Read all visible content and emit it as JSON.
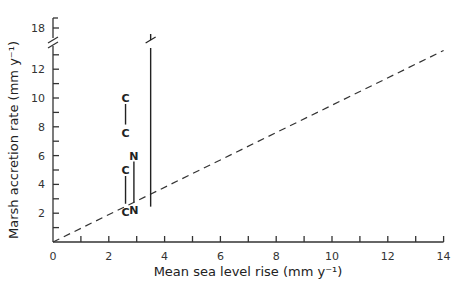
{
  "chart_data": {
    "type": "scatter",
    "title": "",
    "xlabel": "Mean sea level rise (mm y⁻¹)",
    "ylabel": "Marsh accretion rate (mm y⁻¹)",
    "xlim": [
      0,
      14
    ],
    "ylim": [
      0,
      18
    ],
    "y_axis_break": {
      "from": 14,
      "to": 18
    },
    "x_ticks": [
      0,
      2,
      4,
      6,
      8,
      10,
      12,
      14
    ],
    "x_tick_labels": [
      "0",
      "2",
      "4",
      "6",
      "8",
      "10",
      "12",
      "14"
    ],
    "y_ticks": [
      2,
      4,
      6,
      8,
      10,
      12,
      18
    ],
    "y_tick_labels": [
      "2",
      "4",
      "6",
      "8",
      "10",
      "12",
      "18"
    ],
    "grid": false,
    "legend": null,
    "reference_line": {
      "style": "dashed",
      "from": [
        0,
        0
      ],
      "to": [
        14,
        13.3
      ],
      "label": "accretion = sea level rise"
    },
    "series": [
      {
        "name": "C",
        "points": [
          [
            2.6,
            10.0
          ],
          [
            2.6,
            7.6
          ]
        ],
        "connected": true
      },
      {
        "name": "C",
        "points": [
          [
            2.6,
            5.0
          ],
          [
            2.6,
            2.1
          ]
        ],
        "connected": true
      },
      {
        "name": "N",
        "points": [
          [
            2.9,
            6.0
          ],
          [
            2.9,
            2.2
          ]
        ],
        "connected": true
      },
      {
        "name": "M",
        "points": [
          [
            3.5,
            1.9
          ],
          [
            3.5,
            18.0
          ]
        ],
        "connected": true
      },
      {
        "name": "D",
        "points": [
          [
            3.8,
            6.4
          ],
          [
            3.8,
            4.6
          ]
        ],
        "connected": true
      },
      {
        "name": "L",
        "points": [
          [
            11.1,
            13.3
          ],
          [
            11.1,
            12.9
          ],
          [
            11.1,
            10.3
          ],
          [
            11.1,
            6.4
          ],
          [
            11.1,
            6.0
          ],
          [
            11.1,
            5.6
          ],
          [
            12.0,
            6.9
          ],
          [
            13.1,
            7.3
          ],
          [
            13.1,
            13.0
          ]
        ],
        "connected": false
      }
    ]
  }
}
